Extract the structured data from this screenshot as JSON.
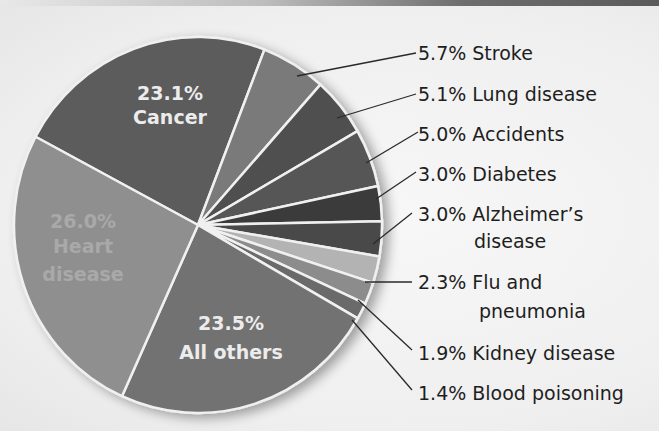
{
  "chart_data": {
    "type": "pie",
    "title": "",
    "unit": "%",
    "slices": [
      {
        "label": "Cancer",
        "value": 23.1,
        "color": "#5b5b5b",
        "label_position": "inside"
      },
      {
        "label": "Stroke",
        "value": 5.7,
        "color": "#7a7a7a",
        "label_position": "callout"
      },
      {
        "label": "Lung disease",
        "value": 5.1,
        "color": "#4f4f4f",
        "label_position": "callout"
      },
      {
        "label": "Accidents",
        "value": 5.0,
        "color": "#575757",
        "label_position": "callout"
      },
      {
        "label": "Diabetes",
        "value": 3.0,
        "color": "#3a3a3a",
        "label_position": "callout"
      },
      {
        "label": "Alzheimer's disease",
        "value": 3.0,
        "color": "#4a4a4a",
        "label_position": "callout"
      },
      {
        "label": "Flu and pneumonia",
        "value": 2.3,
        "color": "#b3b3b3",
        "label_position": "callout"
      },
      {
        "label": "Kidney disease",
        "value": 1.9,
        "color": "#8c8c8c",
        "label_position": "callout"
      },
      {
        "label": "Blood poisoning",
        "value": 1.4,
        "color": "#6a6a6a",
        "label_position": "callout"
      },
      {
        "label": "All others",
        "value": 23.5,
        "color": "#727272",
        "label_position": "inside"
      },
      {
        "label": "Heart disease",
        "value": 26.0,
        "color": "#8f8f8f",
        "label_position": "inside"
      }
    ],
    "legend": "none (callout labels)",
    "separator_color": "#f0f0f0"
  },
  "labels": {
    "cancer": {
      "pct": "23.1%",
      "name": "Cancer"
    },
    "heart": {
      "pct": "26.0%",
      "line1": "Heart",
      "line2": "disease"
    },
    "others": {
      "pct": "23.5%",
      "name": "All others"
    },
    "stroke": "5.7% Stroke",
    "lung": "5.1% Lung disease",
    "accidents": "5.0% Accidents",
    "diabetes": "3.0% Diabetes",
    "alzheimers_line1": "3.0% Alzheimer’s",
    "alzheimers_line2": "disease",
    "flu_line1": "2.3% Flu and",
    "flu_line2": "pneumonia",
    "kidney": "1.9% Kidney disease",
    "blood": "1.4% Blood poisoning"
  }
}
